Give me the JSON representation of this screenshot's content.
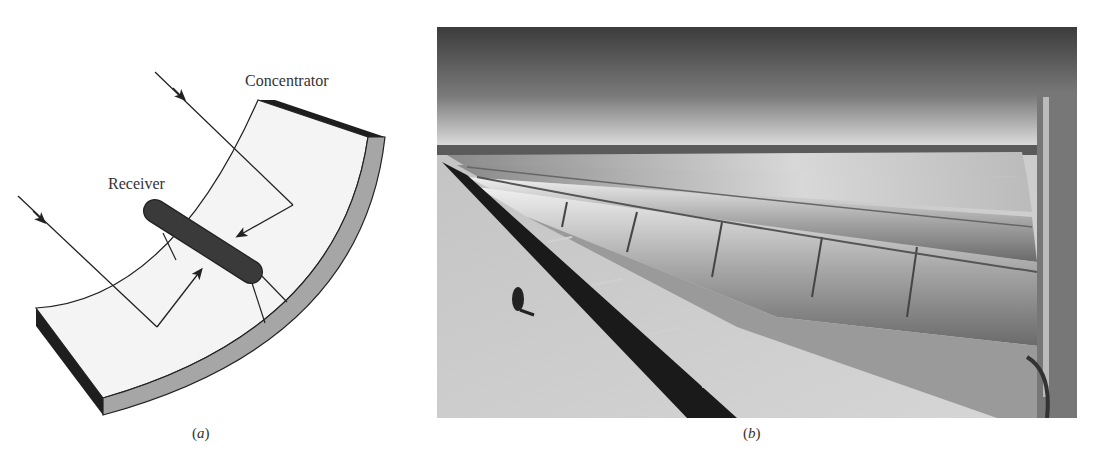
{
  "figure": {
    "panel_a": {
      "type": "schematic diagram",
      "labels": {
        "concentrator": "Concentrator",
        "receiver": "Receiver"
      },
      "caption_open": "(",
      "caption_letter": "a",
      "caption_close": ")",
      "colors": {
        "trough_face": "#f4f4f4",
        "trough_rim": "#a6a6a6",
        "trough_edge": "#1e1e1e",
        "receiver_tube": "#3a3a3a",
        "lines": "#222222"
      }
    },
    "panel_b": {
      "type": "photograph",
      "description": "Rows of parabolic trough solar collectors in a desert, with a person walking alongside",
      "caption_open": "(",
      "caption_letter": "b",
      "caption_close": ")"
    }
  }
}
